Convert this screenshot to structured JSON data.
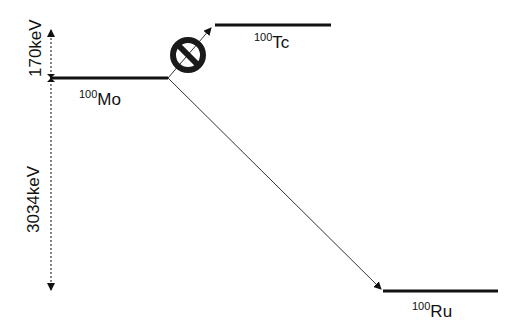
{
  "diagram": {
    "type": "nuclear-decay-level-scheme",
    "levels": [
      {
        "id": "mo",
        "mass": "100",
        "element": "Mo"
      },
      {
        "id": "tc",
        "mass": "100",
        "element": "Tc"
      },
      {
        "id": "ru",
        "mass": "100",
        "element": "Ru"
      }
    ],
    "energy_labels": {
      "mo_to_tc": "170keV",
      "mo_to_ru": "3034keV"
    },
    "transitions": [
      {
        "from": "Mo",
        "to": "Tc",
        "status": "forbidden",
        "icon": "prohibited-icon"
      },
      {
        "from": "Mo",
        "to": "Ru",
        "status": "allowed"
      }
    ]
  }
}
